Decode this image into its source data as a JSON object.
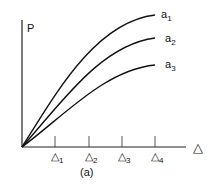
{
  "figure": {
    "caption": "(a)",
    "y_axis_label": "P",
    "x_axis_label": "△",
    "x_ticks": [
      {
        "base": "△",
        "sub": "1"
      },
      {
        "base": "△",
        "sub": "2"
      },
      {
        "base": "△",
        "sub": "3"
      },
      {
        "base": "△",
        "sub": "4"
      }
    ],
    "curves": [
      {
        "base": "a",
        "sub": "1"
      },
      {
        "base": "a",
        "sub": "2"
      },
      {
        "base": "a",
        "sub": "3"
      }
    ],
    "line_color": "#111111"
  }
}
